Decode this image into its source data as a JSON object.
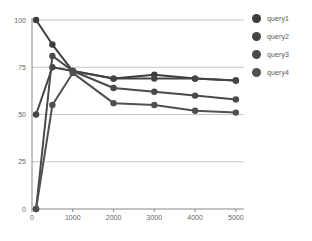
{
  "chart_data": {
    "type": "line",
    "title": "",
    "xlabel": "",
    "ylabel": "",
    "xlim": [
      0,
      5200
    ],
    "ylim": [
      0,
      100
    ],
    "x": [
      100,
      500,
      1000,
      2000,
      3000,
      4000,
      5000
    ],
    "xticks": [
      "0",
      "1000",
      "2000",
      "3000",
      "4000",
      "5000"
    ],
    "xtick_values": [
      0,
      1000,
      2000,
      3000,
      4000,
      5000
    ],
    "yticks": [
      "0",
      "25",
      "50",
      "75",
      "100"
    ],
    "ytick_values": [
      0,
      25,
      50,
      75,
      100
    ],
    "grid": "horizontal",
    "legend_position": "right",
    "series": [
      {
        "name": "query1",
        "color": "#3d3d3d",
        "values": [
          100,
          87,
          73,
          69,
          71,
          69,
          68
        ]
      },
      {
        "name": "query2",
        "color": "#444444",
        "values": [
          50,
          75,
          73,
          69,
          69,
          69,
          68
        ]
      },
      {
        "name": "query3",
        "color": "#4a4a4a",
        "values": [
          0,
          81,
          73,
          64,
          62,
          60,
          58
        ]
      },
      {
        "name": "query4",
        "color": "#505050",
        "values": [
          0,
          55,
          72,
          56,
          55,
          52,
          51
        ]
      }
    ]
  },
  "legend": {
    "items": [
      {
        "label": "query1",
        "color": "#3d3d3d"
      },
      {
        "label": "query2",
        "color": "#444444"
      },
      {
        "label": "query3",
        "color": "#4a4a4a"
      },
      {
        "label": "query4",
        "color": "#505050"
      }
    ]
  },
  "axes": {
    "y_labels": [
      "100",
      "75",
      "50",
      "25",
      "0"
    ],
    "x_labels": [
      "0",
      "1000",
      "2000",
      "3000",
      "4000",
      "5000"
    ]
  },
  "colors": {
    "grid": "#b9b9b9",
    "axis": "#888888",
    "text": "#666666",
    "background": "#ffffff"
  }
}
